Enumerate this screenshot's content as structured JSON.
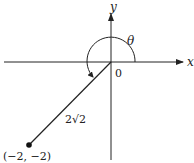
{
  "diagram": {
    "type": "polar-coordinate-angle",
    "axes": {
      "x_label": "x",
      "y_label": "y",
      "origin_label": "0"
    },
    "angle_label": "θ",
    "segment_label": "2√2",
    "point": {
      "label": "(−2, −2)",
      "x": -2,
      "y": -2
    },
    "colors": {
      "line": "#222222",
      "background": "#ffffff"
    }
  }
}
